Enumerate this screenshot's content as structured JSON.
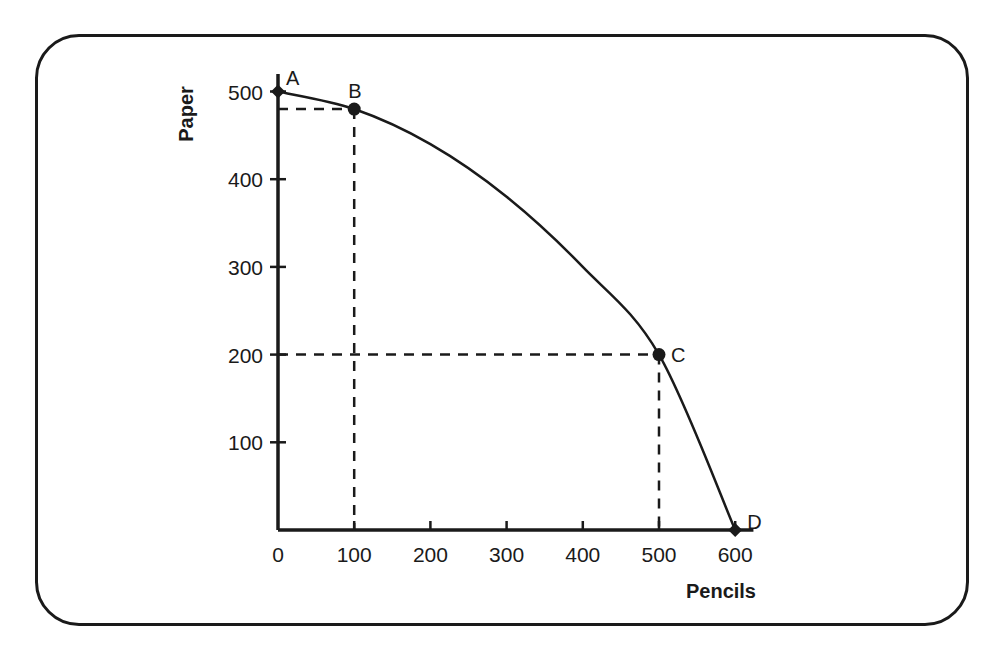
{
  "chart_data": {
    "type": "line",
    "title": "",
    "xlabel": "Pencils",
    "ylabel": "Paper",
    "x_ticks": [
      0,
      100,
      200,
      300,
      400,
      500,
      600
    ],
    "y_ticks": [
      100,
      200,
      300,
      400,
      500
    ],
    "x_tick_labels": [
      "0",
      "100",
      "200",
      "300",
      "400",
      "500",
      "600"
    ],
    "y_tick_labels": [
      "100",
      "200",
      "300",
      "400",
      "500"
    ],
    "xlim": [
      0,
      620
    ],
    "ylim": [
      0,
      520
    ],
    "grid": false,
    "legend": null,
    "series": [
      {
        "name": "Production Possibilities Frontier",
        "x": [
          0,
          100,
          200,
          300,
          400,
          500,
          600
        ],
        "y": [
          500,
          480,
          440,
          380,
          300,
          200,
          0
        ]
      }
    ],
    "points": [
      {
        "label": "A",
        "x": 0,
        "y": 500,
        "marker": "diamond"
      },
      {
        "label": "B",
        "x": 100,
        "y": 480,
        "marker": "circle"
      },
      {
        "label": "C",
        "x": 500,
        "y": 200,
        "marker": "circle"
      },
      {
        "label": "D",
        "x": 600,
        "y": 0,
        "marker": "diamond"
      }
    ],
    "reference_lines": [
      {
        "from_point": "B",
        "dashed": true,
        "to": [
          "x-axis",
          "y-axis"
        ]
      },
      {
        "from_point": "C",
        "dashed": true,
        "to": [
          "x-axis",
          "y-axis"
        ]
      }
    ]
  },
  "style": {
    "line_color": "#1a1a1a",
    "background": "#ffffff"
  }
}
